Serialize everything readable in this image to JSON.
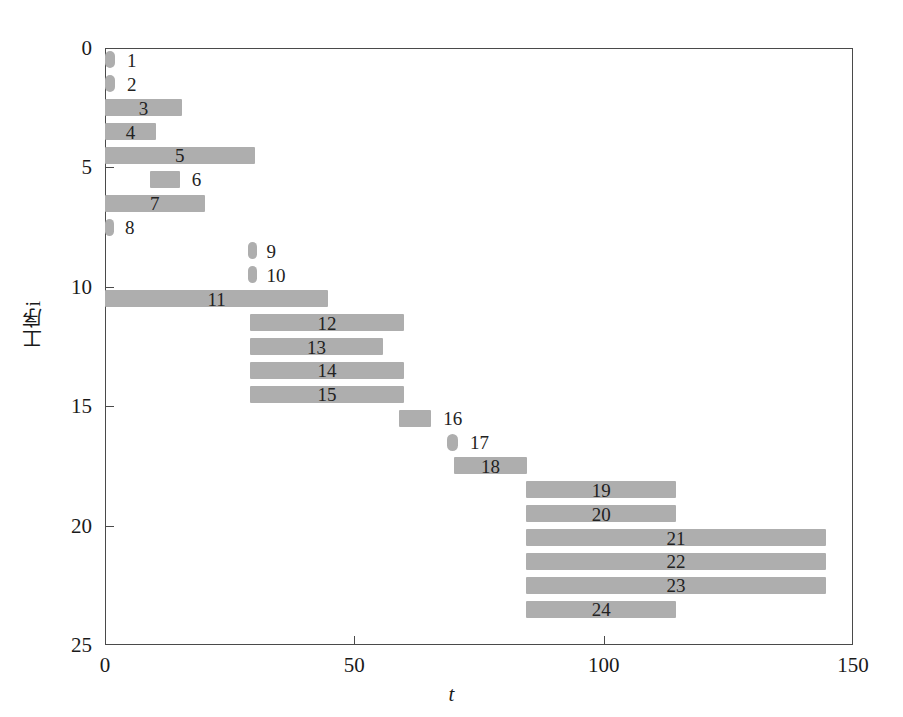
{
  "chart_data": {
    "type": "bar",
    "chart_subtype": "gantt",
    "title": "",
    "xlabel": "t",
    "ylabel": "工序 i",
    "ylabel_text": "工序i",
    "xlim": [
      0,
      150
    ],
    "ylim": [
      0,
      25
    ],
    "y_inverted": true,
    "xticks": [
      0,
      50,
      100,
      150
    ],
    "xticklabels": [
      "0",
      "50",
      "100",
      "150"
    ],
    "yticks": [
      0,
      5,
      10,
      15,
      20,
      25
    ],
    "yticklabels": [
      "0",
      "5",
      "10",
      "15",
      "20",
      "25"
    ],
    "grid": false,
    "legend": false,
    "bar_color": "#aeaeae",
    "axis_color": "#4a4a4a",
    "categories": [
      "1",
      "2",
      "3",
      "4",
      "5",
      "6",
      "7",
      "8",
      "9",
      "10",
      "11",
      "12",
      "13",
      "14",
      "15",
      "16",
      "17",
      "18",
      "19",
      "20",
      "21",
      "22",
      "23",
      "24"
    ],
    "tasks": [
      {
        "label": "1",
        "row": 1,
        "start": 0,
        "end": 2,
        "duration": 2
      },
      {
        "label": "2",
        "row": 2,
        "start": 0,
        "end": 2,
        "duration": 2
      },
      {
        "label": "3",
        "row": 3,
        "start": 0,
        "end": 15.4,
        "duration": 15.4
      },
      {
        "label": "4",
        "row": 4,
        "start": 0,
        "end": 10.2,
        "duration": 10.2
      },
      {
        "label": "5",
        "row": 5,
        "start": 0,
        "end": 30.0,
        "duration": 30.0
      },
      {
        "label": "6",
        "row": 6,
        "start": 9.0,
        "end": 15.0,
        "duration": 6.0
      },
      {
        "label": "7",
        "row": 7,
        "start": 0,
        "end": 20.0,
        "duration": 20.0
      },
      {
        "label": "8",
        "row": 8,
        "start": 0,
        "end": 1.6,
        "duration": 1.6
      },
      {
        "label": "9",
        "row": 9,
        "start": 28.6,
        "end": 30.0,
        "duration": 1.4
      },
      {
        "label": "10",
        "row": 10,
        "start": 28.6,
        "end": 30.0,
        "duration": 1.4
      },
      {
        "label": "11",
        "row": 11,
        "start": 0,
        "end": 44.8,
        "duration": 44.8
      },
      {
        "label": "12",
        "row": 12,
        "start": 29.0,
        "end": 60.0,
        "duration": 31.0
      },
      {
        "label": "13",
        "row": 13,
        "start": 29.0,
        "end": 55.8,
        "duration": 26.8
      },
      {
        "label": "14",
        "row": 14,
        "start": 29.0,
        "end": 60.0,
        "duration": 31.0
      },
      {
        "label": "15",
        "row": 15,
        "start": 29.0,
        "end": 60.0,
        "duration": 31.0
      },
      {
        "label": "16",
        "row": 16,
        "start": 59.0,
        "end": 65.4,
        "duration": 6.4
      },
      {
        "label": "17",
        "row": 17,
        "start": 68.6,
        "end": 70.8,
        "duration": 2.2
      },
      {
        "label": "18",
        "row": 18,
        "start": 70.0,
        "end": 84.6,
        "duration": 14.6
      },
      {
        "label": "19",
        "row": 19,
        "start": 84.4,
        "end": 114.6,
        "duration": 30.2
      },
      {
        "label": "20",
        "row": 20,
        "start": 84.4,
        "end": 114.6,
        "duration": 30.2
      },
      {
        "label": "21",
        "row": 21,
        "start": 84.4,
        "end": 144.6,
        "duration": 60.2
      },
      {
        "label": "22",
        "row": 22,
        "start": 84.4,
        "end": 144.6,
        "duration": 60.2
      },
      {
        "label": "23",
        "row": 23,
        "start": 84.4,
        "end": 144.6,
        "duration": 60.2
      },
      {
        "label": "24",
        "row": 24,
        "start": 84.4,
        "end": 114.6,
        "duration": 30.2
      }
    ]
  }
}
